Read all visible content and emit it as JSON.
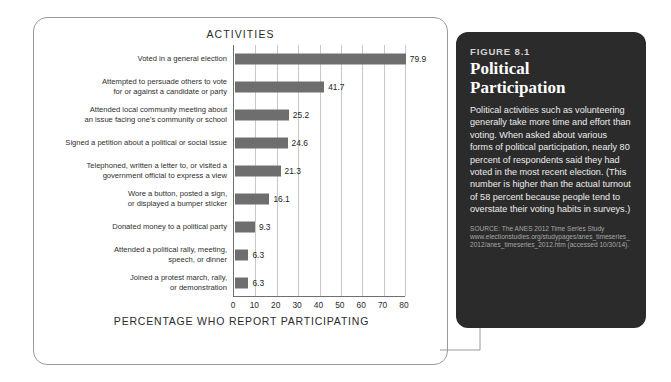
{
  "chart_data": {
    "type": "bar",
    "orientation": "horizontal",
    "title": "ACTIVITIES",
    "xlabel": "PERCENTAGE WHO REPORT PARTICIPATING",
    "ylabel": "",
    "xlim": [
      0,
      80
    ],
    "xticks": [
      "0",
      "10",
      "20",
      "30",
      "40",
      "50",
      "60",
      "70",
      "80"
    ],
    "grid": true,
    "legend": "none",
    "bar_color": "#6e6e6e",
    "categories": [
      "Voted in a general election",
      "Attempted to persuade others to vote\nfor or against a candidate or party",
      "Attended local community meeting about\nan issue facing one's community or school",
      "Signed a petition about a political or social issue",
      "Telephoned, written a letter to, or visited a\ngovernment official to express a view",
      "Wore a button, posted a sign,\nor displayed a bumper sticker",
      "Donated money to a political party",
      "Attended a political rally, meeting,\nspeech, or dinner",
      "Joined a protest march, rally,\nor demonstration"
    ],
    "values": [
      79.9,
      41.7,
      25.2,
      24.6,
      21.3,
      16.1,
      9.3,
      6.3,
      6.3
    ],
    "value_labels": [
      "79.9",
      "41.7",
      "25.2",
      "24.6",
      "21.3",
      "16.1",
      "9.3",
      "6.3",
      "6.3"
    ]
  },
  "caption": {
    "figure_number": "FIGURE 8.1",
    "title_line1": "Political",
    "title_line2": "Participation",
    "body": "Political activities such as volunteering generally take more time and effort than voting. When asked about various forms of political participation, nearly 80 percent of respondents said they had voted in the most recent election. (This number is higher than the actual turnout of 58 percent because people tend to overstate their voting habits in surveys.)",
    "source": "SOURCE: The ANES 2012 Time Series Study www.electionstudies.org/studypages/anes_timeseries_2012/anes_timeseries_2012.htm (accessed 10/30/14)."
  },
  "colors": {
    "panel_background": "#2b2b2b",
    "bar": "#6e6e6e",
    "gridline": "#c9c9c9",
    "axis": "#6f6f6f",
    "card_border": "#9a9a9a"
  }
}
